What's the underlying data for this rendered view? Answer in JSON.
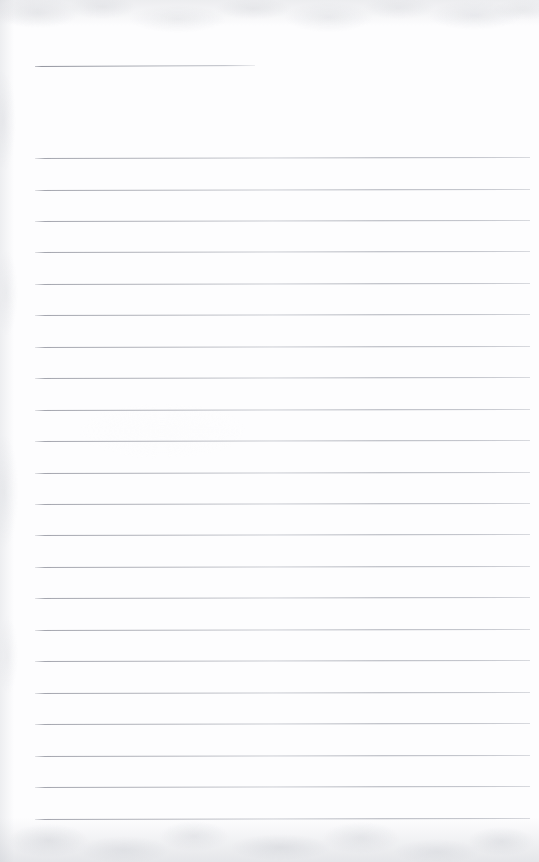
{
  "document": {
    "kind": "scanned-ruled-notepad-page",
    "title": "",
    "content_text": "",
    "page_width": 539,
    "page_height": 862,
    "paper_color": "#fdfdfe",
    "rule_color": "#a8aab2",
    "texture_color": "#c4c6cc"
  },
  "title_rule": {
    "label": "",
    "x": 35,
    "y": 66,
    "width": 220,
    "rotation_deg": -0.25
  },
  "body_rules": {
    "count": 22,
    "first_y": 158,
    "spacing": 31.45,
    "x": 35,
    "width": 495,
    "rotation_deg": -0.12,
    "lines": [
      {
        "index": 1,
        "y": 158.0,
        "text": ""
      },
      {
        "index": 2,
        "y": 189.5,
        "text": ""
      },
      {
        "index": 3,
        "y": 220.9,
        "text": ""
      },
      {
        "index": 4,
        "y": 252.4,
        "text": ""
      },
      {
        "index": 5,
        "y": 283.8,
        "text": ""
      },
      {
        "index": 6,
        "y": 315.3,
        "text": ""
      },
      {
        "index": 7,
        "y": 346.7,
        "text": ""
      },
      {
        "index": 8,
        "y": 378.2,
        "text": ""
      },
      {
        "index": 9,
        "y": 409.6,
        "text": ""
      },
      {
        "index": 10,
        "y": 441.1,
        "text": ""
      },
      {
        "index": 11,
        "y": 472.5,
        "text": ""
      },
      {
        "index": 12,
        "y": 504.0,
        "text": ""
      },
      {
        "index": 13,
        "y": 535.4,
        "text": ""
      },
      {
        "index": 14,
        "y": 566.9,
        "text": ""
      },
      {
        "index": 15,
        "y": 598.3,
        "text": ""
      },
      {
        "index": 16,
        "y": 629.8,
        "text": ""
      },
      {
        "index": 17,
        "y": 661.2,
        "text": ""
      },
      {
        "index": 18,
        "y": 692.7,
        "text": ""
      },
      {
        "index": 19,
        "y": 724.1,
        "text": ""
      },
      {
        "index": 20,
        "y": 755.6,
        "text": ""
      },
      {
        "index": 21,
        "y": 787.0,
        "text": ""
      },
      {
        "index": 22,
        "y": 818.5,
        "text": ""
      }
    ]
  }
}
